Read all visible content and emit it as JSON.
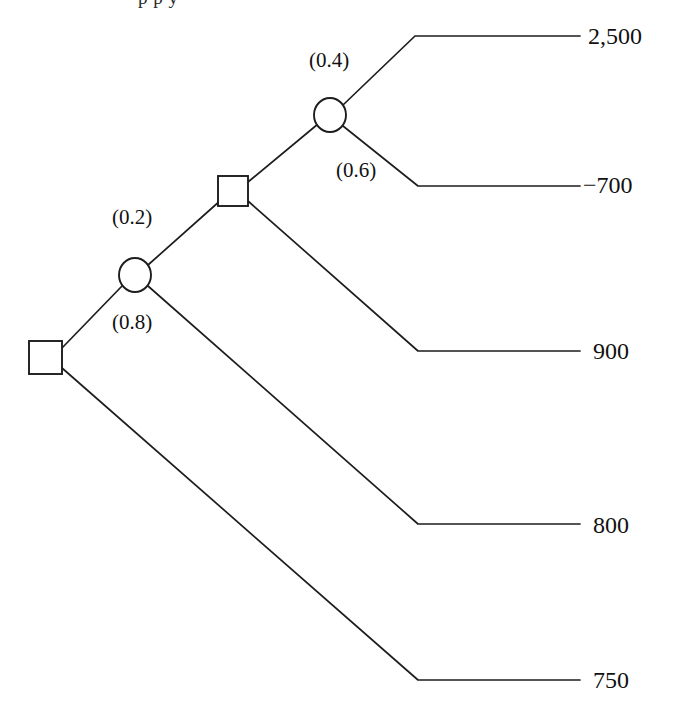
{
  "diagram": {
    "type": "decision-tree",
    "title_fragment": "p  p  y",
    "nodes": [
      {
        "id": "root",
        "kind": "decision",
        "shape": "square",
        "x": 45,
        "y": 357
      },
      {
        "id": "chance1",
        "kind": "chance",
        "shape": "circle",
        "x": 135,
        "y": 275
      },
      {
        "id": "decision2",
        "kind": "decision",
        "shape": "square",
        "x": 233,
        "y": 191
      },
      {
        "id": "chance2",
        "kind": "chance",
        "shape": "circle",
        "x": 330,
        "y": 115
      }
    ],
    "probabilities": [
      {
        "id": "p-0-2",
        "label": "(0.2)",
        "value": 0.2,
        "x": 112,
        "y": 207
      },
      {
        "id": "p-0-8",
        "label": "(0.8)",
        "value": 0.8,
        "x": 112,
        "y": 312
      },
      {
        "id": "p-0-4",
        "label": "(0.4)",
        "value": 0.4,
        "x": 309,
        "y": 50
      },
      {
        "id": "p-0-6",
        "label": "(0.6)",
        "value": 0.6,
        "x": 336,
        "y": 160
      }
    ],
    "payoffs": [
      {
        "id": "payoff-2500",
        "label": "2,500",
        "value": 2500,
        "x": 588,
        "y": 24
      },
      {
        "id": "payoff-minus-700",
        "label": "−700",
        "value": -700,
        "x": 588,
        "y": 173
      },
      {
        "id": "payoff-900",
        "label": "900",
        "value": 900,
        "x": 593,
        "y": 339
      },
      {
        "id": "payoff-800",
        "label": "800",
        "value": 800,
        "x": 593,
        "y": 513
      },
      {
        "id": "payoff-750",
        "label": "750",
        "value": 750,
        "x": 593,
        "y": 668
      }
    ]
  }
}
